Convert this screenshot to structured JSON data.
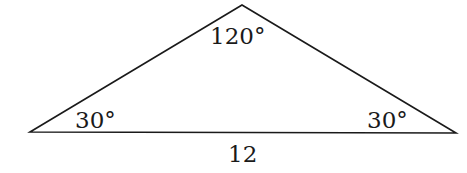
{
  "diagram": {
    "shape": "triangle",
    "vertices": {
      "left": {
        "x": 30,
        "y": 132
      },
      "top": {
        "x": 242,
        "y": 5
      },
      "right": {
        "x": 456,
        "y": 133
      }
    },
    "angles": {
      "top": "120°",
      "left": "30°",
      "right": "30°"
    },
    "sides": {
      "base": "12"
    },
    "stroke_color": "#1a1a1a"
  }
}
